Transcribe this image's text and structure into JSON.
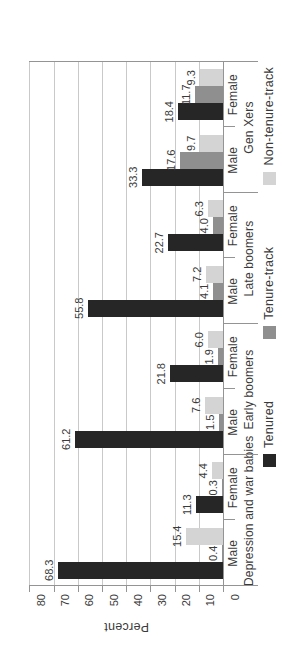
{
  "figure": {
    "orientation_note": "landscape bar chart rotated 90 degrees counterclockwise on portrait page",
    "y_axis_title": "Percent"
  },
  "chart_data": {
    "type": "bar",
    "title": "",
    "xlabel": "",
    "ylabel": "Percent",
    "ylim": [
      0,
      80
    ],
    "ytick_step": 10,
    "yticks": [
      0,
      10,
      20,
      30,
      40,
      50,
      60,
      70,
      80
    ],
    "grid": true,
    "legend_position": "bottom",
    "value_labels_shown": true,
    "generations": [
      "Depression and war babies",
      "Early boomers",
      "Late boomers",
      "Gen Xers"
    ],
    "categories": [
      "Male",
      "Female",
      "Male",
      "Female",
      "Male",
      "Female",
      "Male",
      "Female"
    ],
    "series": [
      {
        "name": "Tenured",
        "color": "#262626",
        "values": [
          68.3,
          11.3,
          61.2,
          21.8,
          55.8,
          22.7,
          33.3,
          18.4
        ]
      },
      {
        "name": "Tenure-track",
        "color": "#8f8f8f",
        "values": [
          0.4,
          0.3,
          1.5,
          1.9,
          4.1,
          4.0,
          17.6,
          11.7
        ]
      },
      {
        "name": "Non-tenure-track",
        "color": "#d4d4d4",
        "values": [
          15.4,
          4.4,
          7.6,
          6.0,
          7.2,
          6.3,
          9.7,
          9.3
        ]
      }
    ],
    "colors": {
      "gridline": "#c9c9c9",
      "axis_line": "#949494",
      "text": "#3a3a3a",
      "background": "#ffffff"
    }
  }
}
